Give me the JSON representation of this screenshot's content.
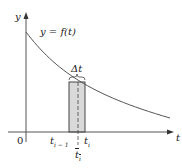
{
  "diagram": {
    "y_axis_label": "y",
    "x_axis_label": "t",
    "origin_label": "0",
    "curve_label": "y = f(t)",
    "delta_label": "Δt",
    "left_endpoint_label": "t",
    "left_endpoint_sub": "i − 1",
    "right_endpoint_label": "t",
    "right_endpoint_sub": "i",
    "sample_point_label": "t",
    "sample_point_sub": "i",
    "colors": {
      "curve": "#555555",
      "axes": "#555555",
      "rect_fill": "#d9d9d9",
      "rect_stroke": "#444444"
    }
  }
}
